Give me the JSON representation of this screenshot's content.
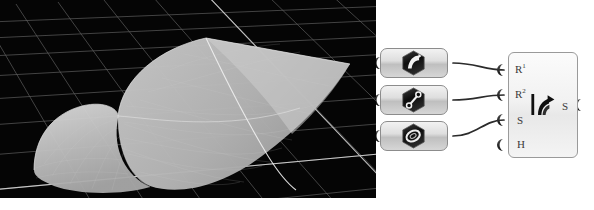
{
  "figure": {
    "background_color": "#ffffff"
  },
  "viewport": {
    "name": "rhino-perspective-viewport",
    "background_color": "#000000",
    "grid_color": "#8a8a8a",
    "grid_major_color": "#c9c9c9",
    "surface_fill": "#b9b9b9",
    "surface_highlight": "#d8d8d8",
    "surface_isocurve_color": "#efefef",
    "geometry_label": "rail-revolve-surface",
    "grid_columns": 14,
    "grid_rows": 9
  },
  "node_canvas": {
    "background_color": "#ffffff",
    "wire_color": "#2b2b2b",
    "port_color": "#1c1c1c",
    "param_nodes": [
      {
        "name": "curve-param",
        "icon": "curve-icon",
        "label": "Curve",
        "x": 4,
        "y": 48
      },
      {
        "name": "line-param",
        "icon": "line-icon",
        "label": "Line",
        "x": 4,
        "y": 85
      },
      {
        "name": "circle-param",
        "icon": "circle-icon",
        "label": "Circle",
        "x": 4,
        "y": 121
      }
    ],
    "component": {
      "name": "rail-revolve-component",
      "label": "Rail Revolve",
      "icon": "rail-revolve-icon",
      "inputs": [
        {
          "name": "input-r1",
          "label": "R",
          "sup": "1",
          "connected": true
        },
        {
          "name": "input-r2",
          "label": "R",
          "sup": "2",
          "connected": true
        },
        {
          "name": "input-s",
          "label": "S",
          "sup": "",
          "connected": true
        },
        {
          "name": "input-h",
          "label": "H",
          "sup": "",
          "connected": false
        }
      ],
      "outputs": [
        {
          "name": "output-s",
          "label": "S",
          "connected": false
        }
      ]
    }
  }
}
